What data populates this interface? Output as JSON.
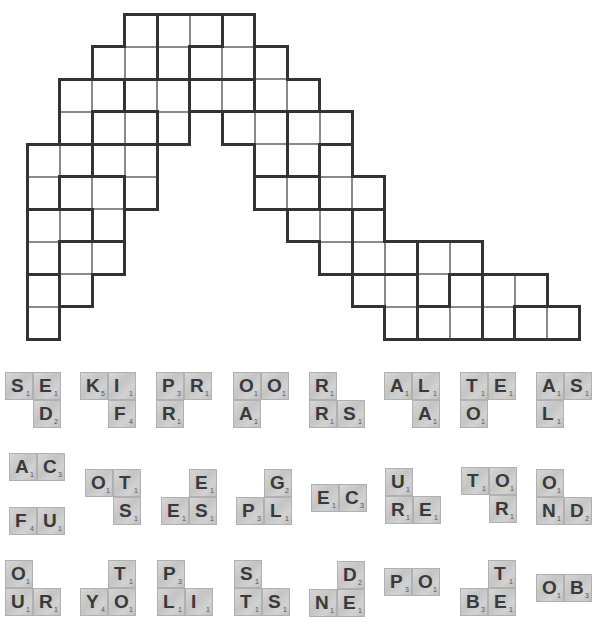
{
  "puzzle": {
    "grid": {
      "origin_x": 27,
      "origin_y": 14,
      "cell_size": 32.5,
      "rows": [
        {
          "row": 0,
          "cols": [
            3,
            4,
            5,
            6
          ]
        },
        {
          "row": 1,
          "cols": [
            2,
            3,
            4,
            5,
            6,
            7
          ]
        },
        {
          "row": 2,
          "cols": [
            1,
            2,
            3,
            4,
            5,
            6,
            7,
            8
          ]
        },
        {
          "row": 3,
          "cols": [
            1,
            2,
            3,
            4,
            6,
            7,
            8,
            9
          ]
        },
        {
          "row": 4,
          "cols": [
            0,
            1,
            2,
            3,
            7,
            8,
            9
          ]
        },
        {
          "row": 5,
          "cols": [
            0,
            1,
            2,
            3,
            7,
            8,
            9,
            10
          ]
        },
        {
          "row": 6,
          "cols": [
            0,
            1,
            2,
            8,
            9,
            10
          ]
        },
        {
          "row": 7,
          "cols": [
            0,
            1,
            2,
            9,
            10,
            11,
            12,
            13
          ]
        },
        {
          "row": 8,
          "cols": [
            0,
            1,
            10,
            11,
            12,
            13,
            14,
            15
          ]
        },
        {
          "row": 9,
          "cols": [
            0,
            11,
            12,
            13,
            14,
            15,
            16
          ]
        }
      ],
      "regions": [
        [
          [
            0,
            3
          ],
          [
            1,
            2
          ],
          [
            1,
            3
          ]
        ],
        [
          [
            0,
            4
          ],
          [
            0,
            5
          ],
          [
            1,
            4
          ]
        ],
        [
          [
            0,
            6
          ],
          [
            1,
            5
          ],
          [
            1,
            6
          ]
        ],
        [
          [
            1,
            7
          ],
          [
            2,
            7
          ],
          [
            2,
            8
          ]
        ],
        [
          [
            2,
            1
          ],
          [
            2,
            2
          ],
          [
            3,
            1
          ]
        ],
        [
          [
            2,
            3
          ],
          [
            2,
            4
          ],
          [
            3,
            4
          ]
        ],
        [
          [
            2,
            5
          ],
          [
            2,
            6
          ]
        ],
        [
          [
            3,
            2
          ],
          [
            3,
            3
          ]
        ],
        [
          [
            3,
            6
          ],
          [
            3,
            7
          ],
          [
            4,
            7
          ]
        ],
        [
          [
            3,
            8
          ],
          [
            3,
            9
          ],
          [
            4,
            8
          ]
        ],
        [
          [
            4,
            9
          ],
          [
            5,
            9
          ],
          [
            5,
            10
          ]
        ],
        [
          [
            5,
            7
          ],
          [
            5,
            8
          ]
        ],
        [
          [
            4,
            0
          ],
          [
            5,
            0
          ],
          [
            4,
            1
          ]
        ],
        [
          [
            4,
            2
          ],
          [
            4,
            3
          ],
          [
            5,
            3
          ]
        ],
        [
          [
            5,
            1
          ],
          [
            5,
            2
          ],
          [
            6,
            2
          ]
        ],
        [
          [
            6,
            0
          ],
          [
            6,
            1
          ],
          [
            7,
            0
          ]
        ],
        [
          [
            7,
            1
          ],
          [
            7,
            2
          ],
          [
            8,
            1
          ]
        ],
        [
          [
            8,
            0
          ],
          [
            9,
            0
          ]
        ],
        [
          [
            6,
            8
          ],
          [
            6,
            9
          ],
          [
            7,
            9
          ]
        ],
        [
          [
            6,
            10
          ],
          [
            7,
            10
          ],
          [
            7,
            11
          ]
        ],
        [
          [
            7,
            12
          ],
          [
            7,
            13
          ],
          [
            8,
            12
          ]
        ],
        [
          [
            8,
            10
          ],
          [
            8,
            11
          ],
          [
            9,
            11
          ]
        ],
        [
          [
            8,
            13
          ],
          [
            9,
            12
          ],
          [
            9,
            13
          ]
        ],
        [
          [
            8,
            14
          ],
          [
            8,
            15
          ],
          [
            9,
            14
          ]
        ],
        [
          [
            9,
            15
          ],
          [
            9,
            16
          ]
        ]
      ]
    },
    "tiles": [
      {
        "name": "tile-group-sed",
        "x": 5,
        "y": 372,
        "cells": [
          {
            "c": 0,
            "r": 0,
            "l": "S",
            "p": "1"
          },
          {
            "c": 1,
            "r": 0,
            "l": "E",
            "p": "1"
          },
          {
            "c": 1,
            "r": 1,
            "l": "D",
            "p": "2"
          }
        ]
      },
      {
        "name": "tile-group-kif",
        "x": 80,
        "y": 372,
        "cells": [
          {
            "c": 0,
            "r": 0,
            "l": "K",
            "p": "5"
          },
          {
            "c": 1,
            "r": 0,
            "l": "I",
            "p": "1"
          },
          {
            "c": 1,
            "r": 1,
            "l": "F",
            "p": "4"
          }
        ]
      },
      {
        "name": "tile-group-prr",
        "x": 156,
        "y": 372,
        "cells": [
          {
            "c": 0,
            "r": 0,
            "l": "P",
            "p": "3"
          },
          {
            "c": 1,
            "r": 0,
            "l": "R",
            "p": "1"
          },
          {
            "c": 0,
            "r": 1,
            "l": "R",
            "p": "1"
          }
        ]
      },
      {
        "name": "tile-group-ooa",
        "x": 233,
        "y": 372,
        "cells": [
          {
            "c": 0,
            "r": 0,
            "l": "O",
            "p": "1"
          },
          {
            "c": 1,
            "r": 0,
            "l": "O",
            "p": "1"
          },
          {
            "c": 0,
            "r": 1,
            "l": "A",
            "p": "1"
          }
        ]
      },
      {
        "name": "tile-group-rrs",
        "x": 309,
        "y": 372,
        "cells": [
          {
            "c": 0,
            "r": 0,
            "l": "R",
            "p": "1"
          },
          {
            "c": 0,
            "r": 1,
            "l": "R",
            "p": "1"
          },
          {
            "c": 1,
            "r": 1,
            "l": "S",
            "p": "1"
          }
        ]
      },
      {
        "name": "tile-group-ala",
        "x": 384,
        "y": 372,
        "cells": [
          {
            "c": 0,
            "r": 0,
            "l": "A",
            "p": "1"
          },
          {
            "c": 1,
            "r": 0,
            "l": "L",
            "p": "1"
          },
          {
            "c": 1,
            "r": 1,
            "l": "A",
            "p": "1"
          }
        ]
      },
      {
        "name": "tile-group-teo",
        "x": 460,
        "y": 372,
        "cells": [
          {
            "c": 0,
            "r": 0,
            "l": "T",
            "p": "1"
          },
          {
            "c": 1,
            "r": 0,
            "l": "E",
            "p": "1"
          },
          {
            "c": 0,
            "r": 1,
            "l": "O",
            "p": "1"
          }
        ]
      },
      {
        "name": "tile-group-asl",
        "x": 536,
        "y": 372,
        "cells": [
          {
            "c": 0,
            "r": 0,
            "l": "A",
            "p": "1"
          },
          {
            "c": 1,
            "r": 0,
            "l": "S",
            "p": "1"
          },
          {
            "c": 0,
            "r": 1,
            "l": "L",
            "p": "1"
          }
        ]
      },
      {
        "name": "tile-group-ac",
        "x": 9,
        "y": 453,
        "cells": [
          {
            "c": 0,
            "r": 0,
            "l": "A",
            "p": "1"
          },
          {
            "c": 1,
            "r": 0,
            "l": "C",
            "p": "3"
          }
        ]
      },
      {
        "name": "tile-group-fu",
        "x": 9,
        "y": 507,
        "cells": [
          {
            "c": 0,
            "r": 0,
            "l": "F",
            "p": "4"
          },
          {
            "c": 1,
            "r": 0,
            "l": "U",
            "p": "1"
          }
        ]
      },
      {
        "name": "tile-group-ots",
        "x": 85,
        "y": 469,
        "cells": [
          {
            "c": 0,
            "r": 0,
            "l": "O",
            "p": "1"
          },
          {
            "c": 1,
            "r": 0,
            "l": "T",
            "p": "1"
          },
          {
            "c": 1,
            "r": 1,
            "l": "S",
            "p": "1"
          }
        ]
      },
      {
        "name": "tile-group-ees",
        "x": 161,
        "y": 469,
        "cells": [
          {
            "c": 1,
            "r": 0,
            "l": "E",
            "p": "1"
          },
          {
            "c": 0,
            "r": 1,
            "l": "E",
            "p": "1"
          },
          {
            "c": 1,
            "r": 1,
            "l": "S",
            "p": "1"
          }
        ]
      },
      {
        "name": "tile-group-gpl",
        "x": 236,
        "y": 469,
        "cells": [
          {
            "c": 1,
            "r": 0,
            "l": "G",
            "p": "2"
          },
          {
            "c": 0,
            "r": 1,
            "l": "P",
            "p": "3"
          },
          {
            "c": 1,
            "r": 1,
            "l": "L",
            "p": "1"
          }
        ]
      },
      {
        "name": "tile-group-ec",
        "x": 311,
        "y": 484,
        "cells": [
          {
            "c": 0,
            "r": 0,
            "l": "E",
            "p": "1"
          },
          {
            "c": 1,
            "r": 0,
            "l": "C",
            "p": "3"
          }
        ]
      },
      {
        "name": "tile-group-ure",
        "x": 385,
        "y": 468,
        "cells": [
          {
            "c": 0,
            "r": 0,
            "l": "U",
            "p": "1"
          },
          {
            "c": 0,
            "r": 1,
            "l": "R",
            "p": "1"
          },
          {
            "c": 1,
            "r": 1,
            "l": "E",
            "p": "1"
          }
        ]
      },
      {
        "name": "tile-group-tor",
        "x": 461,
        "y": 467,
        "cells": [
          {
            "c": 0,
            "r": 0,
            "l": "T",
            "p": "1"
          },
          {
            "c": 1,
            "r": 0,
            "l": "O",
            "p": "1"
          },
          {
            "c": 1,
            "r": 1,
            "l": "R",
            "p": "1"
          }
        ]
      },
      {
        "name": "tile-group-ond",
        "x": 536,
        "y": 469,
        "cells": [
          {
            "c": 0,
            "r": 0,
            "l": "O",
            "p": "1"
          },
          {
            "c": 0,
            "r": 1,
            "l": "N",
            "p": "1"
          },
          {
            "c": 1,
            "r": 1,
            "l": "D",
            "p": "2"
          }
        ]
      },
      {
        "name": "tile-group-our",
        "x": 5,
        "y": 560,
        "cells": [
          {
            "c": 0,
            "r": 0,
            "l": "O",
            "p": "1"
          },
          {
            "c": 0,
            "r": 1,
            "l": "U",
            "p": "1"
          },
          {
            "c": 1,
            "r": 1,
            "l": "R",
            "p": "1"
          }
        ]
      },
      {
        "name": "tile-group-tyo",
        "x": 80,
        "y": 560,
        "cells": [
          {
            "c": 1,
            "r": 0,
            "l": "T",
            "p": "1"
          },
          {
            "c": 0,
            "r": 1,
            "l": "Y",
            "p": "4"
          },
          {
            "c": 1,
            "r": 1,
            "l": "O",
            "p": "1"
          }
        ]
      },
      {
        "name": "tile-group-pli",
        "x": 157,
        "y": 560,
        "cells": [
          {
            "c": 0,
            "r": 0,
            "l": "P",
            "p": "3"
          },
          {
            "c": 0,
            "r": 1,
            "l": "L",
            "p": "1"
          },
          {
            "c": 1,
            "r": 1,
            "l": "I",
            "p": "1"
          }
        ]
      },
      {
        "name": "tile-group-sts",
        "x": 234,
        "y": 560,
        "cells": [
          {
            "c": 0,
            "r": 0,
            "l": "S",
            "p": "1"
          },
          {
            "c": 0,
            "r": 1,
            "l": "T",
            "p": "1"
          },
          {
            "c": 1,
            "r": 1,
            "l": "S",
            "p": "1"
          }
        ]
      },
      {
        "name": "tile-group-dne",
        "x": 309,
        "y": 561,
        "cells": [
          {
            "c": 1,
            "r": 0,
            "l": "D",
            "p": "2"
          },
          {
            "c": 0,
            "r": 1,
            "l": "N",
            "p": "1"
          },
          {
            "c": 1,
            "r": 1,
            "l": "E",
            "p": "1"
          }
        ]
      },
      {
        "name": "tile-group-po",
        "x": 384,
        "y": 568,
        "cells": [
          {
            "c": 0,
            "r": 0,
            "l": "P",
            "p": "3"
          },
          {
            "c": 1,
            "r": 0,
            "l": "O",
            "p": "1"
          }
        ]
      },
      {
        "name": "tile-group-tbe",
        "x": 460,
        "y": 560,
        "cells": [
          {
            "c": 1,
            "r": 0,
            "l": "T",
            "p": "1"
          },
          {
            "c": 0,
            "r": 1,
            "l": "B",
            "p": "3"
          },
          {
            "c": 1,
            "r": 1,
            "l": "E",
            "p": "1"
          }
        ]
      },
      {
        "name": "tile-group-ob",
        "x": 536,
        "y": 574,
        "cells": [
          {
            "c": 0,
            "r": 0,
            "l": "O",
            "p": "1"
          },
          {
            "c": 1,
            "r": 0,
            "l": "B",
            "p": "3"
          }
        ]
      }
    ],
    "colors": {
      "grid_line_thin": "#8a8a8a",
      "grid_line_thick": "#333333",
      "tile_face": "#cfcfcf",
      "tile_letter": "#3a3a3a"
    }
  }
}
